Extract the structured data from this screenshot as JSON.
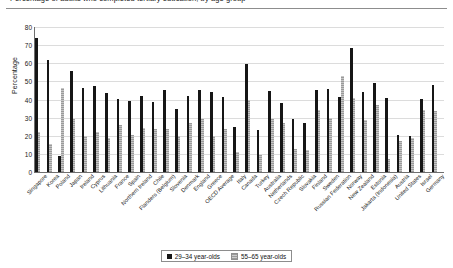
{
  "figure": {
    "title_fragment": "Percentage of adults who completed tertiary education, by age group",
    "legend": {
      "series_dark_label": "29–34 year-olds",
      "series_light_label": "55–65 year-olds",
      "dark_color": "#161616",
      "light_color": "#b3b3b3"
    }
  },
  "chart_data": {
    "type": "bar",
    "title": "Percentage of adults who completed tertiary education, by age group",
    "xlabel": "",
    "ylabel": "Percentage",
    "ylim": [
      0,
      80
    ],
    "yticks": [
      0,
      10,
      20,
      30,
      40,
      50,
      60,
      70,
      80
    ],
    "grid": true,
    "legend_position": "bottom",
    "categories": [
      "Singapore",
      "Korea",
      "Poland",
      "Japan",
      "Ireland",
      "Cyprus",
      "Lithuania",
      "France",
      "Spain",
      "Northern Ireland",
      "Chile",
      "Flanders (Belgium)",
      "Slovenia",
      "Denmark",
      "England",
      "Greece",
      "OECD Average",
      "Italy",
      "Canada",
      "Turkey",
      "Australia",
      "Netherlands",
      "Czech Republic",
      "Slovakia",
      "Finland",
      "Sweden",
      "Russian Federation",
      "Norway",
      "New Zealand",
      "Estonia",
      "Jakarta (Indonesia)",
      "Austria",
      "United States",
      "Israel",
      "Germany"
    ],
    "series": [
      {
        "name": "29–34 year-olds",
        "color": "#161616",
        "values": [
          74,
          62,
          9,
          56,
          46.5,
          47.5,
          43.5,
          40.5,
          39,
          42,
          38.5,
          45.5,
          35,
          42,
          45.5,
          44,
          41.5,
          25,
          59.5,
          23,
          44.5,
          38,
          29,
          27,
          45,
          46,
          41.5,
          68.5,
          44,
          49,
          41,
          20.5,
          20,
          40.5,
          48
        ]
      },
      {
        "name": "55–65 year-olds",
        "color": "#b3b3b3",
        "values": [
          22,
          15.5,
          46.5,
          29,
          20,
          22,
          19,
          26,
          20.5,
          24.5,
          24,
          24,
          20,
          27,
          29,
          20,
          24,
          11,
          39.5,
          9.5,
          29,
          27,
          12.5,
          12,
          34,
          30,
          53,
          41,
          28.5,
          37,
          7,
          17,
          19,
          34,
          33.5
        ]
      }
    ]
  }
}
